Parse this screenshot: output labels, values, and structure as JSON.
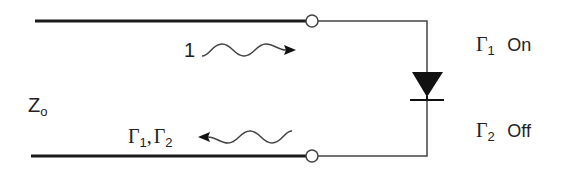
{
  "diagram": {
    "type": "transmission-line-switch",
    "line": {
      "impedance_label": "Z",
      "impedance_sub": "o"
    },
    "incident_wave": {
      "label": "1",
      "direction": "right"
    },
    "reflected_wave": {
      "label_g1": "Γ",
      "label_g1_sub": "1",
      "separator": ",",
      "label_g2": "Γ",
      "label_g2_sub": "2",
      "direction": "left"
    },
    "states": [
      {
        "symbol": "Γ",
        "sub": "1",
        "state": "On"
      },
      {
        "symbol": "Γ",
        "sub": "2",
        "state": "Off"
      }
    ],
    "components": {
      "diode": "diode-icon",
      "terminals": [
        "terminal-top",
        "terminal-bottom"
      ]
    },
    "colors": {
      "thick_line": "#1a1a1a",
      "thin_line": "#444444",
      "diode_fill": "#111111",
      "text": "#222222"
    }
  }
}
